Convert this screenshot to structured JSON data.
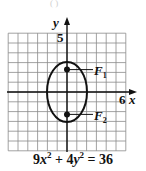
{
  "diagram": {
    "type": "ellipse-graph",
    "top_fragment": "(   )",
    "axes": {
      "x_label": "x",
      "y_label": "y",
      "x_tick_label": "6",
      "y_tick_label": "5",
      "x_range": [
        -6,
        6
      ],
      "y_range": [
        -6,
        6
      ],
      "grid": true,
      "grid_step": 1
    },
    "ellipse": {
      "center": [
        0,
        0
      ],
      "semi_axis_x": 2,
      "semi_axis_y": 3,
      "orientation": "vertical"
    },
    "foci": [
      {
        "label": "F",
        "subscript": "1",
        "x": 0,
        "y": 2.24
      },
      {
        "label": "F",
        "subscript": "2",
        "x": 0,
        "y": -2.24
      }
    ],
    "equation": {
      "c1": "9",
      "v1": "x",
      "e1": "2",
      "op1": " + ",
      "c2": "4",
      "v2": "y",
      "e2": "2",
      "op2": " = ",
      "rhs": "36"
    },
    "colors": {
      "ink": "#111111",
      "grid": "#8a8a8a",
      "background": "#ffffff"
    }
  }
}
